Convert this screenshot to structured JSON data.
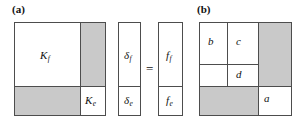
{
  "figure": {
    "background_color": "#ffffff",
    "line_color": "#4d4d4d",
    "shaded_color": "#c9c9c9",
    "text_color": "#111111"
  },
  "panel_a": {
    "label": "(a)",
    "matrix": {
      "name": "stiffness-matrix",
      "blocks": [
        {
          "label_base": "K",
          "label_sub": "f",
          "shaded": false
        },
        {
          "label_base": "",
          "label_sub": "",
          "shaded": true
        },
        {
          "label_base": "",
          "label_sub": "",
          "shaded": true
        },
        {
          "label_base": "K",
          "label_sub": "e",
          "shaded": false
        }
      ]
    },
    "delta_vector": {
      "name": "displacement-vector",
      "entries": [
        {
          "label_base": "δ",
          "label_sub": "f"
        },
        {
          "label_base": "δ",
          "label_sub": "e"
        }
      ]
    },
    "equals_sign": "=",
    "force_vector": {
      "name": "force-vector",
      "entries": [
        {
          "label_base": "f",
          "label_sub": "f"
        },
        {
          "label_base": "f",
          "label_sub": "e"
        }
      ]
    }
  },
  "panel_b": {
    "label": "(b)",
    "matrix": {
      "name": "partitioned-matrix",
      "cells": [
        {
          "label": "b",
          "shaded": false
        },
        {
          "label": "c",
          "shaded": false
        },
        {
          "label": "",
          "shaded": true
        },
        {
          "label": "",
          "shaded": false
        },
        {
          "label": "d",
          "shaded": false
        },
        {
          "label": "",
          "shaded": true
        },
        {
          "label": "",
          "shaded": true
        },
        {
          "label": "",
          "shaded": true
        },
        {
          "label": "a",
          "shaded": false
        }
      ]
    }
  }
}
